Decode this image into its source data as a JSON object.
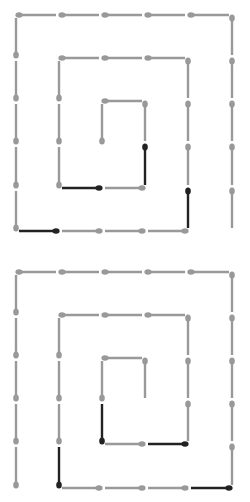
{
  "colors": {
    "inactive": "#999999",
    "active": "#222222",
    "background": "#ffffff"
  },
  "grid": {
    "xs": [
      16,
      59,
      102,
      145,
      188,
      232
    ]
  },
  "spirals": [
    {
      "name": "top-spiral",
      "ys": [
        15,
        58,
        101,
        144,
        188,
        231
      ],
      "segments": [
        {
          "from": [
            0,
            0
          ],
          "to": [
            1,
            0
          ],
          "dot": "start",
          "state": "inactive"
        },
        {
          "from": [
            1,
            0
          ],
          "to": [
            2,
            0
          ],
          "dot": "start",
          "state": "inactive"
        },
        {
          "from": [
            2,
            0
          ],
          "to": [
            3,
            0
          ],
          "dot": "start",
          "state": "inactive"
        },
        {
          "from": [
            3,
            0
          ],
          "to": [
            4,
            0
          ],
          "dot": "start",
          "state": "inactive"
        },
        {
          "from": [
            4,
            0
          ],
          "to": [
            5,
            0
          ],
          "dot": "start",
          "state": "inactive"
        },
        {
          "from": [
            5,
            0
          ],
          "to": [
            5,
            1
          ],
          "dot": "start",
          "state": "inactive"
        },
        {
          "from": [
            5,
            1
          ],
          "to": [
            5,
            2
          ],
          "dot": "start",
          "state": "inactive"
        },
        {
          "from": [
            5,
            2
          ],
          "to": [
            5,
            3
          ],
          "dot": "start",
          "state": "inactive"
        },
        {
          "from": [
            5,
            3
          ],
          "to": [
            5,
            4
          ],
          "dot": "start",
          "state": "inactive"
        },
        {
          "from": [
            5,
            4
          ],
          "to": [
            5,
            5
          ],
          "dot": "start",
          "state": "inactive"
        },
        {
          "from": [
            0,
            0
          ],
          "to": [
            0,
            1
          ],
          "dot": "end",
          "state": "inactive"
        },
        {
          "from": [
            0,
            1
          ],
          "to": [
            0,
            2
          ],
          "dot": "end",
          "state": "inactive"
        },
        {
          "from": [
            0,
            2
          ],
          "to": [
            0,
            3
          ],
          "dot": "end",
          "state": "inactive"
        },
        {
          "from": [
            0,
            3
          ],
          "to": [
            0,
            4
          ],
          "dot": "end",
          "state": "inactive"
        },
        {
          "from": [
            0,
            4
          ],
          "to": [
            0,
            5
          ],
          "dot": "end",
          "state": "inactive"
        },
        {
          "from": [
            0,
            5
          ],
          "to": [
            1,
            5
          ],
          "dot": "end",
          "state": "active"
        },
        {
          "from": [
            1,
            5
          ],
          "to": [
            2,
            5
          ],
          "dot": "end",
          "state": "inactive"
        },
        {
          "from": [
            2,
            5
          ],
          "to": [
            3,
            5
          ],
          "dot": "end",
          "state": "inactive"
        },
        {
          "from": [
            3,
            5
          ],
          "to": [
            4,
            5
          ],
          "dot": "end",
          "state": "inactive"
        },
        {
          "from": [
            4,
            4
          ],
          "to": [
            4,
            5
          ],
          "dot": "start",
          "state": "active"
        },
        {
          "from": [
            4,
            1
          ],
          "to": [
            4,
            2
          ],
          "dot": "start",
          "state": "inactive"
        },
        {
          "from": [
            4,
            2
          ],
          "to": [
            4,
            3
          ],
          "dot": "start",
          "state": "inactive"
        },
        {
          "from": [
            4,
            3
          ],
          "to": [
            4,
            4
          ],
          "dot": "start",
          "state": "inactive"
        },
        {
          "from": [
            1,
            1
          ],
          "to": [
            2,
            1
          ],
          "dot": "start",
          "state": "inactive"
        },
        {
          "from": [
            2,
            1
          ],
          "to": [
            3,
            1
          ],
          "dot": "start",
          "state": "inactive"
        },
        {
          "from": [
            3,
            1
          ],
          "to": [
            4,
            1
          ],
          "dot": "start",
          "state": "inactive"
        },
        {
          "from": [
            1,
            1
          ],
          "to": [
            1,
            2
          ],
          "dot": "end",
          "state": "inactive"
        },
        {
          "from": [
            1,
            2
          ],
          "to": [
            1,
            3
          ],
          "dot": "end",
          "state": "inactive"
        },
        {
          "from": [
            1,
            3
          ],
          "to": [
            1,
            4
          ],
          "dot": "end",
          "state": "inactive"
        },
        {
          "from": [
            1,
            4
          ],
          "to": [
            2,
            4
          ],
          "dot": "end",
          "state": "active"
        },
        {
          "from": [
            2,
            4
          ],
          "to": [
            3,
            4
          ],
          "dot": "end",
          "state": "inactive"
        },
        {
          "from": [
            3,
            3
          ],
          "to": [
            3,
            4
          ],
          "dot": "start",
          "state": "active"
        },
        {
          "from": [
            3,
            2
          ],
          "to": [
            3,
            3
          ],
          "dot": "start",
          "state": "inactive"
        },
        {
          "from": [
            2,
            2
          ],
          "to": [
            3,
            2
          ],
          "dot": "start",
          "state": "inactive"
        },
        {
          "from": [
            2,
            2
          ],
          "to": [
            2,
            3
          ],
          "dot": "end",
          "state": "inactive"
        }
      ]
    },
    {
      "name": "bottom-spiral",
      "ys": [
        272,
        315,
        358,
        401,
        444,
        488
      ],
      "segments": [
        {
          "from": [
            0,
            0
          ],
          "to": [
            1,
            0
          ],
          "dot": "start",
          "state": "inactive"
        },
        {
          "from": [
            1,
            0
          ],
          "to": [
            2,
            0
          ],
          "dot": "start",
          "state": "inactive"
        },
        {
          "from": [
            2,
            0
          ],
          "to": [
            3,
            0
          ],
          "dot": "start",
          "state": "inactive"
        },
        {
          "from": [
            3,
            0
          ],
          "to": [
            4,
            0
          ],
          "dot": "start",
          "state": "inactive"
        },
        {
          "from": [
            4,
            0
          ],
          "to": [
            5,
            0
          ],
          "dot": "start",
          "state": "inactive"
        },
        {
          "from": [
            5,
            0
          ],
          "to": [
            5,
            1
          ],
          "dot": "start",
          "state": "inactive"
        },
        {
          "from": [
            5,
            1
          ],
          "to": [
            5,
            2
          ],
          "dot": "start",
          "state": "inactive"
        },
        {
          "from": [
            5,
            2
          ],
          "to": [
            5,
            3
          ],
          "dot": "start",
          "state": "inactive"
        },
        {
          "from": [
            5,
            3
          ],
          "to": [
            5,
            4
          ],
          "dot": "start",
          "state": "inactive"
        },
        {
          "from": [
            5,
            4
          ],
          "to": [
            5,
            5
          ],
          "dot": "start",
          "state": "inactive"
        },
        {
          "from": [
            0,
            0
          ],
          "to": [
            0,
            1
          ],
          "dot": "end",
          "state": "inactive"
        },
        {
          "from": [
            0,
            1
          ],
          "to": [
            0,
            2
          ],
          "dot": "end",
          "state": "inactive"
        },
        {
          "from": [
            0,
            2
          ],
          "to": [
            0,
            3
          ],
          "dot": "end",
          "state": "inactive"
        },
        {
          "from": [
            0,
            3
          ],
          "to": [
            0,
            4
          ],
          "dot": "end",
          "state": "inactive"
        },
        {
          "from": [
            0,
            4
          ],
          "to": [
            0,
            5
          ],
          "dot": "end",
          "state": "inactive"
        },
        {
          "from": [
            1,
            5
          ],
          "to": [
            2,
            5
          ],
          "dot": "end",
          "state": "inactive"
        },
        {
          "from": [
            2,
            5
          ],
          "to": [
            3,
            5
          ],
          "dot": "end",
          "state": "inactive"
        },
        {
          "from": [
            3,
            5
          ],
          "to": [
            4,
            5
          ],
          "dot": "end",
          "state": "inactive"
        },
        {
          "from": [
            4,
            5
          ],
          "to": [
            5,
            5
          ],
          "dot": "end",
          "state": "active"
        },
        {
          "from": [
            1,
            1
          ],
          "to": [
            2,
            1
          ],
          "dot": "start",
          "state": "inactive"
        },
        {
          "from": [
            2,
            1
          ],
          "to": [
            3,
            1
          ],
          "dot": "start",
          "state": "inactive"
        },
        {
          "from": [
            3,
            1
          ],
          "to": [
            4,
            1
          ],
          "dot": "start",
          "state": "inactive"
        },
        {
          "from": [
            4,
            1
          ],
          "to": [
            4,
            2
          ],
          "dot": "start",
          "state": "inactive"
        },
        {
          "from": [
            4,
            2
          ],
          "to": [
            4,
            3
          ],
          "dot": "start",
          "state": "inactive"
        },
        {
          "from": [
            4,
            3
          ],
          "to": [
            4,
            4
          ],
          "dot": "start",
          "state": "inactive"
        },
        {
          "from": [
            1,
            1
          ],
          "to": [
            1,
            2
          ],
          "dot": "end",
          "state": "inactive"
        },
        {
          "from": [
            1,
            2
          ],
          "to": [
            1,
            3
          ],
          "dot": "end",
          "state": "inactive"
        },
        {
          "from": [
            1,
            3
          ],
          "to": [
            1,
            4
          ],
          "dot": "end",
          "state": "inactive"
        },
        {
          "from": [
            1,
            4
          ],
          "to": [
            1,
            5
          ],
          "dot": "end",
          "state": "active"
        },
        {
          "from": [
            2,
            4
          ],
          "to": [
            3,
            4
          ],
          "dot": "end",
          "state": "inactive"
        },
        {
          "from": [
            3,
            4
          ],
          "to": [
            4,
            4
          ],
          "dot": "end",
          "state": "active"
        },
        {
          "from": [
            2,
            2
          ],
          "to": [
            3,
            2
          ],
          "dot": "start",
          "state": "inactive"
        },
        {
          "from": [
            3,
            2
          ],
          "to": [
            3,
            3
          ],
          "dot": "start",
          "state": "inactive"
        },
        {
          "from": [
            2,
            2
          ],
          "to": [
            2,
            3
          ],
          "dot": "end",
          "state": "inactive"
        },
        {
          "from": [
            2,
            3
          ],
          "to": [
            2,
            4
          ],
          "dot": "end",
          "state": "active"
        }
      ]
    }
  ]
}
